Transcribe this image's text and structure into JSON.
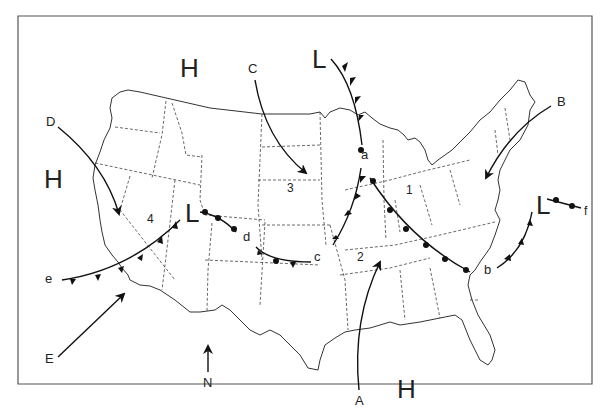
{
  "map": {
    "type": "weather-map",
    "region": "United States",
    "pressure_centers": [
      {
        "symbol": "H",
        "x": 205,
        "y": 68
      },
      {
        "symbol": "H",
        "x": 52,
        "y": 178
      },
      {
        "symbol": "H",
        "x": 405,
        "y": 388
      },
      {
        "symbol": "L",
        "x": 320,
        "y": 58
      },
      {
        "symbol": "L",
        "x": 193,
        "y": 240
      },
      {
        "symbol": "L",
        "x": 539,
        "y": 208
      }
    ],
    "air_mass_arrows": [
      {
        "label": "A",
        "x": 379,
        "y": 405
      },
      {
        "label": "B",
        "x": 564,
        "y": 103
      },
      {
        "label": "C",
        "x": 253,
        "y": 69
      },
      {
        "label": "D",
        "x": 51,
        "y": 123
      },
      {
        "label": "E",
        "x": 49,
        "y": 359
      }
    ],
    "front_labels": [
      {
        "label": "a",
        "x": 364,
        "y": 156
      },
      {
        "label": "b",
        "x": 489,
        "y": 271
      },
      {
        "label": "c",
        "x": 319,
        "y": 258
      },
      {
        "label": "d",
        "x": 247,
        "y": 238
      },
      {
        "label": "e",
        "x": 50,
        "y": 279
      },
      {
        "label": "f",
        "x": 586,
        "y": 212
      }
    ],
    "region_numbers": [
      {
        "label": "1",
        "x": 411,
        "y": 191
      },
      {
        "label": "2",
        "x": 362,
        "y": 258
      },
      {
        "label": "3",
        "x": 292,
        "y": 189
      },
      {
        "label": "4",
        "x": 152,
        "y": 220
      }
    ],
    "compass": {
      "label": "N"
    }
  }
}
